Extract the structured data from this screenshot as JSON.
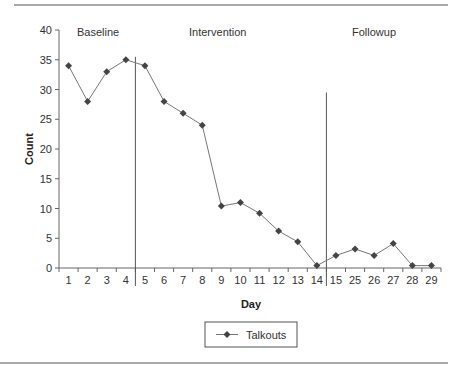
{
  "chart_data": {
    "type": "line",
    "title": "",
    "xlabel": "Day",
    "ylabel": "Count",
    "ylim": [
      0,
      40
    ],
    "yticks": [
      0,
      5,
      10,
      15,
      20,
      25,
      30,
      35,
      40
    ],
    "grid": false,
    "legend_position": "bottom-center",
    "categories": [
      "1",
      "2",
      "3",
      "4",
      "5",
      "6",
      "7",
      "8",
      "9",
      "10",
      "11",
      "12",
      "13",
      "14",
      "15",
      "25",
      "26",
      "27",
      "28",
      "29"
    ],
    "series": [
      {
        "name": "Talkouts",
        "marker": "diamond",
        "values": [
          34,
          28,
          33,
          35,
          34,
          28,
          26,
          24,
          10.4,
          11,
          9.2,
          6.2,
          4.4,
          0.4,
          2.1,
          3.2,
          2.1,
          4.1,
          0.4,
          0.4
        ]
      }
    ],
    "phases": [
      {
        "label": "Baseline",
        "start_day": "1",
        "end_day": "4"
      },
      {
        "label": "Intervention",
        "start_day": "5",
        "end_day": "14"
      },
      {
        "label": "Followup",
        "start_day": "15",
        "end_day": "29"
      }
    ],
    "phase_change_lines": [
      {
        "after_category_index": 3,
        "top_value": 35.5
      },
      {
        "after_category_index": 13,
        "top_value": 29.5
      }
    ]
  },
  "labels": {
    "ylabel": "Count",
    "xlabel": "Day",
    "legend": "Talkouts",
    "phase_baseline": "Baseline",
    "phase_intervention": "Intervention",
    "phase_followup": "Followup"
  },
  "colors": {
    "line": "#777777",
    "marker": "#444444",
    "axis": "#666666",
    "rule": "#555555"
  }
}
